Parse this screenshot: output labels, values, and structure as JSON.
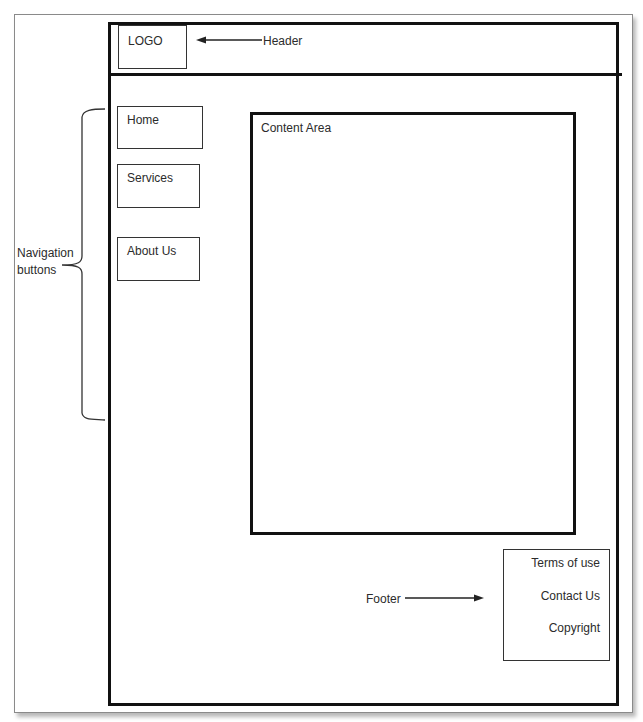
{
  "diagram": {
    "header": {
      "logo_label": "LOGO",
      "annotation": "Header"
    },
    "navigation": {
      "annotation_line1": "Navigation",
      "annotation_line2": "buttons",
      "items": [
        {
          "label": "Home"
        },
        {
          "label": "Services"
        },
        {
          "label": "About Us"
        }
      ]
    },
    "content": {
      "label": "Content Area"
    },
    "footer": {
      "annotation": "Footer",
      "links": [
        {
          "label": "Terms of use"
        },
        {
          "label": "Contact Us"
        },
        {
          "label": "Copyright"
        }
      ]
    },
    "colors": {
      "stroke": "#111111",
      "box_stroke": "#333333",
      "text": "#2b2b2b",
      "background": "#ffffff"
    }
  }
}
